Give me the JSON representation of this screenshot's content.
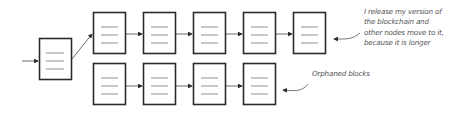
{
  "diagram": {
    "type": "blockchain-fork",
    "colors": {
      "stroke": "#2b2b2b",
      "lines": "#666666",
      "annotation": "#555555"
    },
    "genesis_block": {
      "label": ""
    },
    "top_chain": {
      "block_count": 5
    },
    "bottom_chain": {
      "block_count": 4
    },
    "annotations": {
      "top": [
        "I release my version of",
        "the blockchain and",
        "other nodes move to it,",
        "because it is longer"
      ],
      "bottom": "Orphaned blocks"
    }
  }
}
